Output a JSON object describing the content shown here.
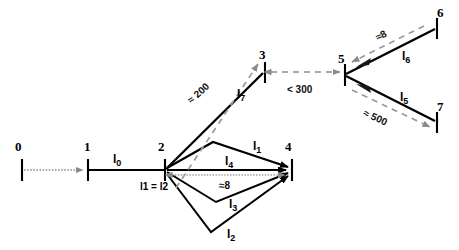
{
  "diagram": {
    "colors": {
      "edge": "#000000",
      "dimension": "#8a8a8a",
      "text": "#000000",
      "background": "#ffffff"
    },
    "nodes": [
      {
        "id": "0",
        "label": "0",
        "x": 22,
        "y": 170,
        "label_x": 15,
        "label_y": 140
      },
      {
        "id": "1",
        "label": "1",
        "x": 88,
        "y": 170,
        "label_x": 84,
        "label_y": 140
      },
      {
        "id": "2",
        "label": "2",
        "x": 165,
        "y": 170,
        "label_x": 158,
        "label_y": 140
      },
      {
        "id": "3",
        "label": "3",
        "x": 265,
        "y": 72,
        "label_x": 259,
        "label_y": 48
      },
      {
        "id": "4",
        "label": "4",
        "x": 292,
        "y": 170,
        "label_x": 285,
        "label_y": 140
      },
      {
        "id": "5",
        "label": "5",
        "x": 345,
        "y": 75,
        "label_x": 338,
        "label_y": 52
      },
      {
        "id": "6",
        "label": "6",
        "x": 437,
        "y": 28,
        "label_x": 437,
        "label_y": 6
      },
      {
        "id": "7",
        "label": "7",
        "x": 437,
        "y": 122,
        "label_x": 437,
        "label_y": 100
      }
    ],
    "paths": [
      {
        "id": "l0",
        "label": "l",
        "sub": "0",
        "from": "1",
        "to": "2",
        "label_x": 113,
        "label_y": 153
      },
      {
        "id": "l1",
        "label": "l",
        "sub": "1",
        "from": "2",
        "to": "4",
        "label_x": 253,
        "label_y": 140
      },
      {
        "id": "l2",
        "label": "l",
        "sub": "2",
        "from": "2",
        "to": "4",
        "label_x": 227,
        "label_y": 228
      },
      {
        "id": "l3",
        "label": "l",
        "sub": "3",
        "from": "2",
        "to": "4",
        "label_x": 229,
        "label_y": 198
      },
      {
        "id": "l4",
        "label": "l",
        "sub": "4",
        "from": "2",
        "to": "4",
        "label_x": 225,
        "label_y": 155
      },
      {
        "id": "l5",
        "label": "l",
        "sub": "5",
        "from": "5",
        "to": "7",
        "label_x": 400,
        "label_y": 91
      },
      {
        "id": "l6",
        "label": "l",
        "sub": "6",
        "from": "5",
        "to": "6",
        "label_x": 402,
        "label_y": 50
      },
      {
        "id": "l7",
        "label": "l",
        "sub": "7",
        "from": "2",
        "to": "3",
        "label_x": 237,
        "label_y": 88
      }
    ],
    "dimensions": [
      {
        "id": "dim-200",
        "text": "≈ 200",
        "x": 212,
        "y": 104,
        "rotate": -42
      },
      {
        "id": "dim-300",
        "text": "< 300",
        "x": 290,
        "y": 85,
        "rotate": 0
      },
      {
        "id": "dim-8-lower",
        "text": "≈8",
        "x": 224,
        "y": 182,
        "rotate": 0
      },
      {
        "id": "dim-8-upper",
        "text": "≈8",
        "x": 375,
        "y": 36,
        "rotate": -28
      },
      {
        "id": "dim-500",
        "text": "≈ 500",
        "x": 371,
        "y": 113,
        "rotate": 25
      }
    ],
    "equalities": [
      {
        "id": "eq-l1-l2",
        "text": "l1 = l2",
        "x": 140,
        "y": 182
      }
    ]
  }
}
